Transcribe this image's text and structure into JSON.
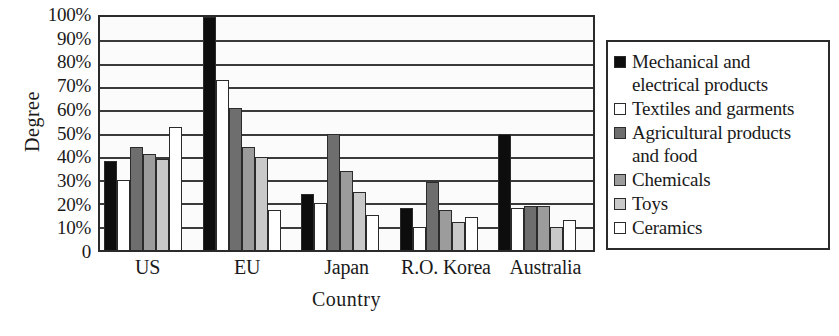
{
  "chart_data": {
    "type": "bar",
    "title": "",
    "xlabel": "Country",
    "ylabel": "Degree",
    "ylim": [
      0,
      100
    ],
    "grid": true,
    "legend_position": "right",
    "categories": [
      "US",
      "EU",
      "Japan",
      "R.O. Korea",
      "Australia"
    ],
    "ytick_labels": [
      "100%",
      "90%",
      "80%",
      "70%",
      "60%",
      "50%",
      "40%",
      "30%",
      "20%",
      "10%",
      "0"
    ],
    "ytick_values": [
      100,
      90,
      80,
      70,
      60,
      50,
      40,
      30,
      20,
      10,
      0
    ],
    "series": [
      {
        "name": "Mechanical and electrical products",
        "color": "#0d0d0d",
        "values": [
          38,
          100,
          24,
          18,
          50
        ]
      },
      {
        "name": "Textiles and garments",
        "color": "#ffffff",
        "values": [
          30,
          73,
          20,
          10,
          18
        ]
      },
      {
        "name": "Agricultural products and food",
        "color": "#6e6e6e",
        "values": [
          44,
          61,
          50,
          29,
          19
        ]
      },
      {
        "name": "Chemicals",
        "color": "#9c9c9c",
        "values": [
          41,
          44,
          34,
          17,
          19
        ]
      },
      {
        "name": "Toys",
        "color": "#c9c9c9",
        "values": [
          39,
          40,
          25,
          12,
          10
        ]
      },
      {
        "name": "Ceramics",
        "color": "#ffffff",
        "values": [
          53,
          17,
          15,
          14,
          13
        ]
      }
    ]
  },
  "axes": {
    "y_title": "Degree",
    "x_title": "Country"
  },
  "legend": {
    "entries": [
      {
        "label": "Mechanical and electrical products",
        "swatch": "black-square-icon"
      },
      {
        "label": "Textiles and garments",
        "swatch": "white-square-icon"
      },
      {
        "label": "Agricultural products and food",
        "swatch": "dark-gray-square-icon"
      },
      {
        "label": "Chemicals",
        "swatch": "medium-gray-square-icon"
      },
      {
        "label": "Toys",
        "swatch": "light-gray-square-icon"
      },
      {
        "label": "Ceramics",
        "swatch": "white-square-icon"
      }
    ]
  }
}
